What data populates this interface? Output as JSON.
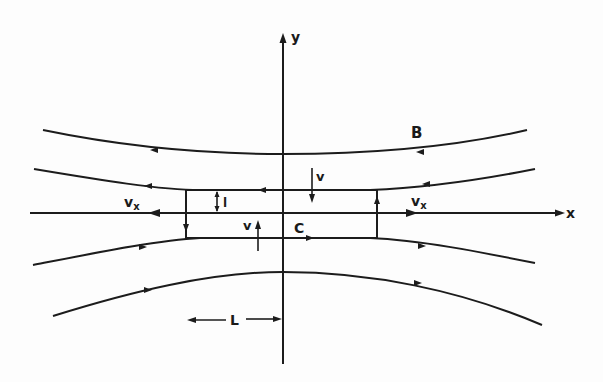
{
  "diagram": {
    "type": "magnetic-reconnection-sheet",
    "axes": {
      "x_label": "x",
      "y_label": "y"
    },
    "labels": {
      "field": "B",
      "outflow_left": "v",
      "outflow_left_sub": "x",
      "outflow_right": "v",
      "outflow_right_sub": "x",
      "inflow_top": "v",
      "inflow_bottom": "v",
      "half_thickness": "l",
      "contour": "C",
      "half_length": "L"
    },
    "field_lines": [
      {
        "name": "upper-outer",
        "direction": "leftward"
      },
      {
        "name": "upper-inner",
        "direction": "leftward"
      },
      {
        "name": "lower-inner",
        "direction": "rightward"
      },
      {
        "name": "lower-outer",
        "direction": "rightward"
      }
    ],
    "colors": {
      "ink": "#1c1c1c",
      "background": "#fdfdfd"
    }
  }
}
